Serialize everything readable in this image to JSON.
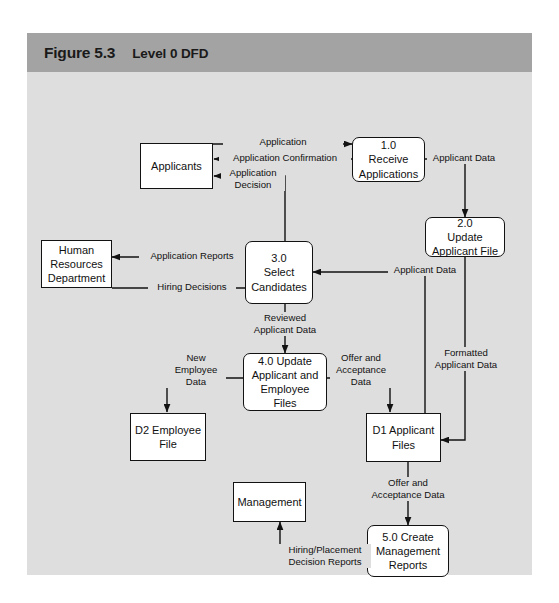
{
  "figure": {
    "number": "Figure 5.3",
    "title": "Level 0 DFD"
  },
  "colors": {
    "header_bar": "#a3a3a3",
    "panel_background": "#dedede",
    "node_fill": "#ffffff",
    "stroke": "#121212",
    "text": "#111111"
  },
  "diagram": {
    "type": "data-flow-diagram",
    "entities": [
      {
        "id": "applicants",
        "label": "Applicants",
        "shape": "rectangle"
      },
      {
        "id": "hr-department",
        "label": "Human\nResources\nDepartment",
        "shape": "rectangle"
      },
      {
        "id": "management",
        "label": "Management",
        "shape": "rectangle"
      }
    ],
    "processes": [
      {
        "id": "p1",
        "label": "1.0\nReceive\nApplications",
        "shape": "rounded-rectangle"
      },
      {
        "id": "p2",
        "label": "2.0\nUpdate\nApplicant File",
        "shape": "rounded-rectangle"
      },
      {
        "id": "p3",
        "label": "3.0\nSelect\nCandidates",
        "shape": "rounded-rectangle"
      },
      {
        "id": "p4",
        "label": "4.0 Update\nApplicant and\nEmployee\nFiles",
        "shape": "rounded-rectangle"
      },
      {
        "id": "p5",
        "label": "5.0 Create\nManagement\nReports",
        "shape": "rounded-rectangle"
      }
    ],
    "data_stores": [
      {
        "id": "d1",
        "label": "D1 Applicant\nFiles",
        "shape": "rectangle"
      },
      {
        "id": "d2",
        "label": "D2 Employee\nFile",
        "shape": "rectangle"
      }
    ],
    "flows": [
      {
        "id": "f1",
        "label": "Application",
        "from": "applicants",
        "to": "p1"
      },
      {
        "id": "f2",
        "label": "Application Confirmation",
        "from": "p1",
        "to": "applicants"
      },
      {
        "id": "f3",
        "label": "Application\nDecision",
        "from": "p3",
        "to": "applicants"
      },
      {
        "id": "f4",
        "label": "Applicant Data",
        "from": "p1",
        "to": "p2"
      },
      {
        "id": "f5",
        "label": "Application Reports",
        "from": "p3",
        "to": "hr-department"
      },
      {
        "id": "f6",
        "label": "Hiring Decisions",
        "from": "hr-department",
        "to": "p3"
      },
      {
        "id": "f7",
        "label": "Reviewed\nApplicant Data",
        "from": "p3",
        "to": "p4"
      },
      {
        "id": "f8",
        "label": "Applicant Data",
        "from": "d1",
        "to": "p3"
      },
      {
        "id": "f9",
        "label": "New\nEmployee\nData",
        "from": "p4",
        "to": "d2"
      },
      {
        "id": "f10",
        "label": "Offer and\nAcceptance\nData",
        "from": "p4",
        "to": "d1"
      },
      {
        "id": "f11",
        "label": "Formatted\nApplicant Data",
        "from": "p2",
        "to": "d1"
      },
      {
        "id": "f12",
        "label": "Offer and\nAcceptance Data",
        "from": "d1",
        "to": "p5"
      },
      {
        "id": "f13",
        "label": "Hiring/Placement\nDecision Reports",
        "from": "p5",
        "to": "management"
      }
    ]
  }
}
